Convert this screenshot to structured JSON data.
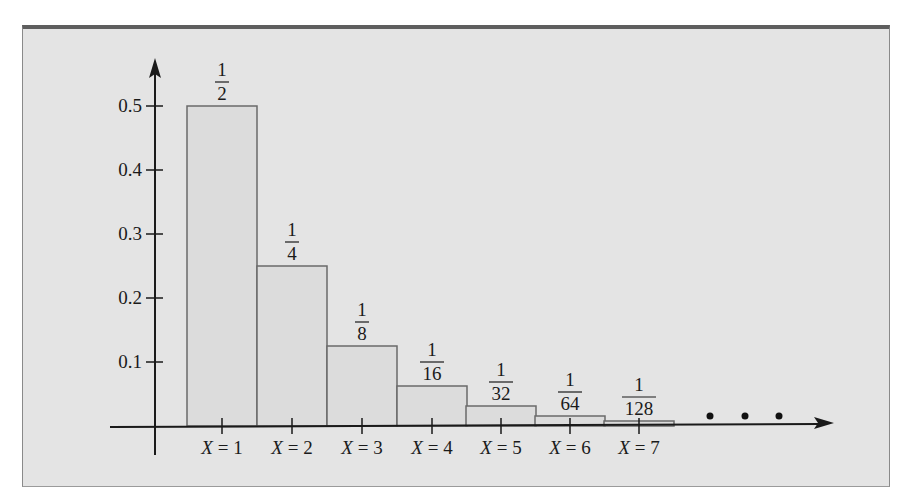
{
  "chart_data": {
    "type": "bar",
    "title": "",
    "xlabel": "",
    "ylabel": "",
    "categories": [
      "X = 1",
      "X = 2",
      "X = 3",
      "X = 4",
      "X = 5",
      "X = 6",
      "X = 7"
    ],
    "values": [
      0.5,
      0.25,
      0.125,
      0.0625,
      0.03125,
      0.015625,
      0.0078125
    ],
    "data_labels": [
      {
        "num": "1",
        "den": "2"
      },
      {
        "num": "1",
        "den": "4"
      },
      {
        "num": "1",
        "den": "8"
      },
      {
        "num": "1",
        "den": "16"
      },
      {
        "num": "1",
        "den": "32"
      },
      {
        "num": "1",
        "den": "64"
      },
      {
        "num": "1",
        "den": "128"
      }
    ],
    "yticks": [
      "0.1",
      "0.2",
      "0.3",
      "0.4",
      "0.5"
    ],
    "ylim": [
      0,
      0.55
    ],
    "grid": false,
    "legend": null,
    "continuation": "• • •",
    "colors": {
      "background": "#e4e4e4",
      "bar_fill": "#dcdcdc",
      "bar_stroke": "#6a6a6a",
      "axis": "#1a1a1a",
      "frame_top": "#5e5e5e"
    }
  }
}
